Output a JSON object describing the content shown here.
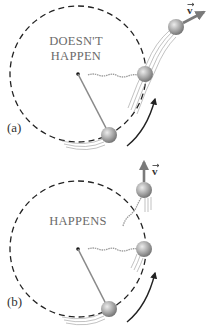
{
  "diagram": {
    "type": "physics-circular-motion",
    "panels": [
      {
        "id": "a",
        "label": "(a)",
        "caption_lines": [
          "DOESN'T",
          "HAPPEN"
        ],
        "velocity_label": "v",
        "velocity_direction": "tangent-outward",
        "description": "Ball released from circular path flies off radially outward — does not happen"
      },
      {
        "id": "b",
        "label": "(b)",
        "caption_lines": [
          "HAPPENS"
        ],
        "velocity_label": "v",
        "velocity_direction": "tangential-up",
        "description": "Ball released from circular path moves off tangentially — happens"
      }
    ],
    "colors": {
      "ball": "#9a9a9a",
      "ball_highlight": "#e2e2e2",
      "dashed_circle": "#222222",
      "string": "#8a8a8a",
      "arrow": "#222222",
      "velocity_arrow": "#7a7a7a",
      "caption": "#6a6a6a"
    }
  }
}
